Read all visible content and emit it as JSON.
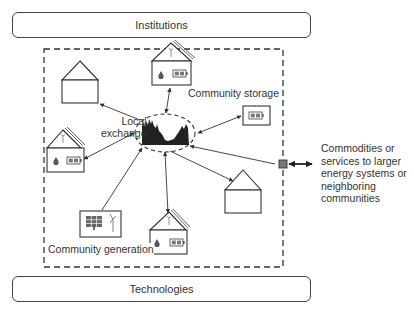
{
  "diagram": {
    "top_bar": {
      "label": "Institutions"
    },
    "bottom_bar": {
      "label": "Technologies"
    },
    "labels": {
      "local_exchange": "Local\nexchange",
      "local_exchange_line1": "Local",
      "local_exchange_line2": "exchange",
      "community_storage": "Community storage",
      "community_generation": "Community generation",
      "external": "Commodities or services to larger energy systems or neighboring communities"
    },
    "nodes": [
      {
        "id": "house-plain-top-left",
        "type": "house",
        "features": []
      },
      {
        "id": "house-top",
        "type": "house",
        "features": [
          "solar-roof",
          "wind",
          "heat",
          "battery"
        ]
      },
      {
        "id": "community-storage",
        "type": "battery-box",
        "label": "Community storage"
      },
      {
        "id": "house-left",
        "type": "house",
        "features": [
          "solar-roof",
          "wind",
          "heat",
          "battery"
        ]
      },
      {
        "id": "house-plain-right",
        "type": "house",
        "features": []
      },
      {
        "id": "community-generation",
        "type": "generation-box",
        "features": [
          "solar-panel",
          "wind-turbine"
        ],
        "label": "Community generation"
      },
      {
        "id": "house-bottom",
        "type": "house",
        "features": [
          "solar-roof",
          "wind",
          "heat",
          "battery"
        ]
      },
      {
        "id": "local-exchange-hub",
        "type": "ellipse",
        "label": "Local exchange"
      },
      {
        "id": "gateway",
        "type": "square"
      }
    ],
    "edges": [
      {
        "from": "local-exchange-hub",
        "to": "house-plain-top-left",
        "direction": "to"
      },
      {
        "from": "local-exchange-hub",
        "to": "house-top",
        "direction": "both"
      },
      {
        "from": "local-exchange-hub",
        "to": "community-storage",
        "direction": "both"
      },
      {
        "from": "local-exchange-hub",
        "to": "house-left",
        "direction": "both"
      },
      {
        "from": "local-exchange-hub",
        "to": "house-plain-right",
        "direction": "to"
      },
      {
        "from": "community-generation",
        "to": "local-exchange-hub",
        "direction": "to"
      },
      {
        "from": "local-exchange-hub",
        "to": "house-bottom",
        "direction": "both"
      },
      {
        "from": "gateway",
        "to": "local-exchange-hub",
        "direction": "to"
      },
      {
        "from": "gateway",
        "to": "external",
        "direction": "both"
      }
    ],
    "colors": {
      "line": "#333333",
      "gateway_fill": "#777777",
      "battery_fill": "#8a8a8a"
    }
  }
}
